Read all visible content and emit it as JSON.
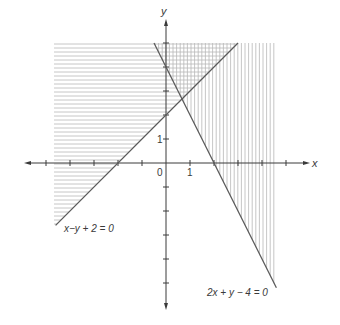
{
  "diagram": {
    "title": "",
    "axes": {
      "x_label": "x",
      "y_label": "y",
      "origin_label": "0",
      "x_tick_label": "1",
      "y_tick_label": "1",
      "x_ticks": [
        -5,
        -4,
        -3,
        -2,
        -1,
        1,
        2,
        3,
        4,
        5
      ],
      "y_ticks": [
        -5,
        -4,
        -3,
        -2,
        -1,
        1,
        2,
        3,
        4,
        5
      ],
      "unit_px": 24
    },
    "lines": [
      {
        "name": "line-1",
        "equation": "x − y + 2 = 0",
        "label": "x−y + 2 = 0",
        "shading": "horizontal",
        "region": "x − y + 2 < 0"
      },
      {
        "name": "line-2",
        "equation": "2x + y − 4 = 0",
        "label": "2x + y − 4 = 0",
        "shading": "vertical",
        "region": "2x + y − 4 > 0"
      }
    ],
    "intersection": {
      "x": "2/3",
      "y": "8/3"
    },
    "colors": {
      "line": "#5a5a5a",
      "axis": "#3a3a3a",
      "hatch": "#b8b8b8",
      "background": "#ffffff"
    }
  }
}
